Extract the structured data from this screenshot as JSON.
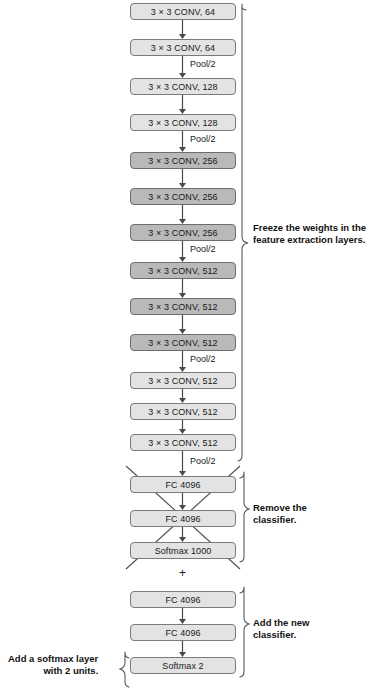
{
  "diagram": {
    "title_alt": "VGG16 transfer learning diagram",
    "colors": {
      "light_block": "#e3e3e3",
      "dark_block": "#b9b9b9",
      "stroke": "#7a7a7a",
      "line": "#4a4a4a",
      "text": "#1a1a1a"
    },
    "nodes": [
      {
        "id": "conv1_1",
        "label": "3 × 3 CONV, 64",
        "shade": "light",
        "top": 3
      },
      {
        "id": "conv1_2",
        "label": "3 × 3 CONV, 64",
        "shade": "light",
        "top": 39
      },
      {
        "id": "conv2_1",
        "label": "3 × 3 CONV, 128",
        "shade": "light",
        "top": 78
      },
      {
        "id": "conv2_2",
        "label": "3 × 3 CONV, 128",
        "shade": "light",
        "top": 114
      },
      {
        "id": "conv3_1",
        "label": "3 × 3 CONV, 256",
        "shade": "dark",
        "top": 152
      },
      {
        "id": "conv3_2",
        "label": "3 × 3 CONV, 256",
        "shade": "dark",
        "top": 188
      },
      {
        "id": "conv3_3",
        "label": "3 × 3 CONV, 256",
        "shade": "dark",
        "top": 224
      },
      {
        "id": "conv4_1",
        "label": "3 × 3 CONV, 512",
        "shade": "dark",
        "top": 262
      },
      {
        "id": "conv4_2",
        "label": "3 × 3 CONV, 512",
        "shade": "dark",
        "top": 298
      },
      {
        "id": "conv4_3",
        "label": "3 × 3 CONV, 512",
        "shade": "dark",
        "top": 334
      },
      {
        "id": "conv5_1",
        "label": "3 × 3 CONV, 512",
        "shade": "light",
        "top": 372
      },
      {
        "id": "conv5_2",
        "label": "3 × 3 CONV, 512",
        "shade": "light",
        "top": 403
      },
      {
        "id": "conv5_3",
        "label": "3 × 3 CONV, 512",
        "shade": "light",
        "top": 434
      },
      {
        "id": "old_fc1",
        "label": "FC 4096",
        "shade": "light",
        "top": 476
      },
      {
        "id": "old_fc2",
        "label": "FC 4096",
        "shade": "light",
        "top": 510
      },
      {
        "id": "old_softmax",
        "label": "Softmax 1000",
        "shade": "light",
        "top": 542
      },
      {
        "id": "new_fc1",
        "label": "FC 4096",
        "shade": "light",
        "top": 591
      },
      {
        "id": "new_fc2",
        "label": "FC 4096",
        "shade": "light",
        "top": 624
      },
      {
        "id": "new_softmax",
        "label": "Softmax 2",
        "shade": "light",
        "top": 657
      }
    ],
    "pool_labels": [
      {
        "id": "pool1",
        "text": "Pool/2",
        "left": 190,
        "top": 59
      },
      {
        "id": "pool2",
        "text": "Pool/2",
        "left": 190,
        "top": 134
      },
      {
        "id": "pool3",
        "text": "Pool/2",
        "left": 190,
        "top": 244
      },
      {
        "id": "pool4",
        "text": "Pool/2",
        "left": 190,
        "top": 354
      },
      {
        "id": "pool5",
        "text": "Pool/2",
        "left": 190,
        "top": 456
      }
    ],
    "plus_symbol": {
      "text": "+",
      "left": 179,
      "top": 566
    },
    "annotations": [
      {
        "id": "freeze",
        "lines": [
          "Freeze the weights in the",
          "feature extraction layers."
        ],
        "left": 253,
        "top": 222,
        "side": "right"
      },
      {
        "id": "remove",
        "lines": [
          "Remove the",
          "classifier."
        ],
        "left": 253,
        "top": 502,
        "side": "right"
      },
      {
        "id": "add_new",
        "lines": [
          "Add the new",
          "classifier."
        ],
        "left": 253,
        "top": 617,
        "side": "right"
      },
      {
        "id": "add_softmax",
        "lines": [
          "Add a softmax layer",
          "with 2 units."
        ],
        "left": 8,
        "top": 653,
        "side": "left"
      }
    ]
  }
}
